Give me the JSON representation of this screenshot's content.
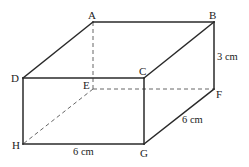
{
  "figure": {
    "type": "cuboid",
    "colors": {
      "edge": "#2a2a2a",
      "hidden_edge": "#555555",
      "text": "#222222",
      "background": "#ffffff"
    },
    "vertices": {
      "A": {
        "label": "A",
        "x": 93,
        "y": 22
      },
      "B": {
        "label": "B",
        "x": 214,
        "y": 22
      },
      "C": {
        "label": "C",
        "x": 144,
        "y": 78
      },
      "D": {
        "label": "D",
        "x": 23,
        "y": 78
      },
      "E": {
        "label": "E",
        "x": 93,
        "y": 89
      },
      "F": {
        "label": "F",
        "x": 214,
        "y": 89
      },
      "G": {
        "label": "G",
        "x": 144,
        "y": 144
      },
      "H": {
        "label": "H",
        "x": 23,
        "y": 144
      }
    },
    "edges_visible": [
      [
        "A",
        "B"
      ],
      [
        "B",
        "C"
      ],
      [
        "C",
        "D"
      ],
      [
        "D",
        "A"
      ],
      [
        "D",
        "H"
      ],
      [
        "H",
        "G"
      ],
      [
        "G",
        "C"
      ],
      [
        "G",
        "F"
      ],
      [
        "F",
        "B"
      ]
    ],
    "edges_hidden": [
      [
        "A",
        "E"
      ],
      [
        "E",
        "F"
      ],
      [
        "E",
        "H"
      ]
    ],
    "dimensions": {
      "height_BF": "3 cm",
      "length_HG": "6 cm",
      "width_GF": "6 cm"
    }
  }
}
